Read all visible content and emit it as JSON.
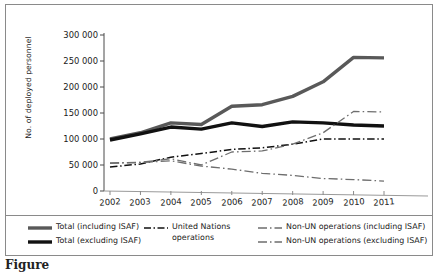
{
  "chart_data": {
    "type": "line",
    "title": "",
    "xlabel": "",
    "ylabel": "No. of deployed personnel",
    "categories": [
      "2002",
      "2003",
      "2004",
      "2005",
      "2006",
      "2007",
      "2008",
      "2009",
      "2010",
      "2011"
    ],
    "x": [
      2002,
      2003,
      2004,
      2005,
      2006,
      2007,
      2008,
      2009,
      2010,
      2011
    ],
    "ylim": [
      0,
      300000
    ],
    "xlim": [
      2002,
      2011
    ],
    "yticks": [
      0,
      50000,
      100000,
      150000,
      200000,
      250000,
      300000
    ],
    "ytick_labels": [
      "0",
      "50 000",
      "100 000",
      "150 000",
      "200 000",
      "250 000",
      "300 000"
    ],
    "grid": false,
    "legend_position": "bottom",
    "series": [
      {
        "name": "Total (including ISAF)",
        "style": "solid",
        "color": "#595959",
        "width": 3.4,
        "values": [
          100000,
          112000,
          131000,
          128000,
          163000,
          166000,
          182000,
          210000,
          257000,
          256000
        ]
      },
      {
        "name": "Total (excluding ISAF)",
        "style": "solid",
        "color": "#111111",
        "width": 3.4,
        "values": [
          98000,
          110000,
          123000,
          119000,
          131000,
          124000,
          133000,
          131000,
          127000,
          125000
        ]
      },
      {
        "name": "United Nations operations",
        "style": "dashdot",
        "color": "#111111",
        "width": 1.5,
        "values": [
          46000,
          52000,
          65000,
          72000,
          80000,
          83000,
          90000,
          100000,
          100000,
          100000
        ]
      },
      {
        "name": "Non-UN operations (including ISAF)",
        "style": "dash",
        "color": "#6e6e6e",
        "width": 1.3,
        "values": [
          54000,
          55000,
          62000,
          50000,
          75000,
          77000,
          90000,
          112000,
          153000,
          152000
        ]
      },
      {
        "name": "Non-UN operations (excluding ISAF)",
        "style": "dash",
        "color": "#6e6e6e",
        "width": 1.3,
        "values": [
          53000,
          55000,
          58000,
          48000,
          42000,
          34000,
          30000,
          24000,
          22000,
          19000
        ]
      }
    ]
  },
  "axis": {
    "y_title": "No. of deployed personnel",
    "y_labels": [
      "300 000",
      "250 000",
      "200 000",
      "150 000",
      "100 000",
      "50 000",
      "0"
    ],
    "x_labels": [
      "2002",
      "2003",
      "2004",
      "2005",
      "2006",
      "2007",
      "2008",
      "2009",
      "2010",
      "2011"
    ]
  },
  "legend": {
    "items": [
      {
        "label": "Total (including ISAF)",
        "style": "solid-gray"
      },
      {
        "label": "Total (excluding ISAF)",
        "style": "solid-black"
      },
      {
        "label": "United Nations\noperations",
        "style": "dashdot-black"
      },
      {
        "label": "Non-UN operations (including ISAF)",
        "style": "dash-gray"
      },
      {
        "label": "Non-UN operations (excluding ISAF)",
        "style": "dash-gray"
      }
    ]
  },
  "caption": {
    "text": "Figure"
  }
}
